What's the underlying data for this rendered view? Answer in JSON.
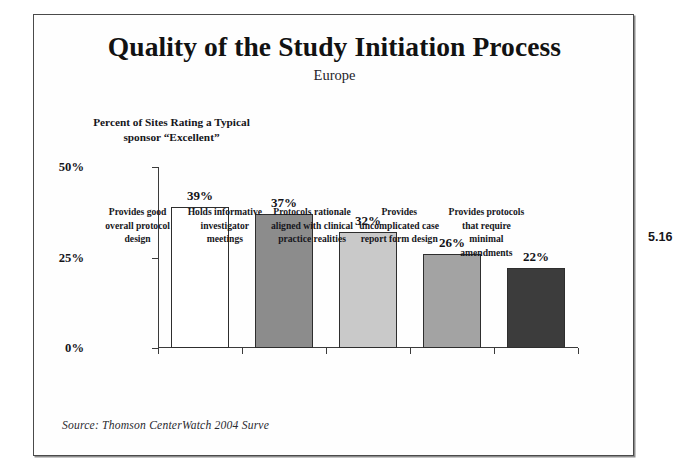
{
  "slide": {
    "title": "Quality of the Study Initiation Process",
    "subtitle": "Europe",
    "page_number": "5.16",
    "source": "Source:  Thomson CenterWatch 2004 Surve",
    "axis_caption_line1": "Percent of Sites Rating a Typical",
    "axis_caption_line2": "sponsor “Excellent”"
  },
  "chart_data": {
    "type": "bar",
    "title": "Quality of the Study Initiation Process",
    "subtitle": "Europe",
    "xlabel": "",
    "ylabel": "Percent of Sites Rating a Typical sponsor “Excellent”",
    "ylim": [
      0,
      50
    ],
    "ytick_labels": [
      "0%",
      "25%",
      "50%"
    ],
    "ytick_values": [
      0,
      25,
      50
    ],
    "grid": false,
    "legend": false,
    "categories": [
      "Provides good overall protocol design",
      "Holds informative investigator meetings",
      "Protocols rationale aligned with clinical practice realities",
      "Provides uncomplicated case report form design",
      "Provides protocols that require minimal amendments"
    ],
    "category_lines": [
      [
        "Provides good",
        "overall protocol",
        "design"
      ],
      [
        "Holds informative",
        "investigator",
        "meetings"
      ],
      [
        "Protocols rationale",
        "aligned with clinical",
        "practice realities"
      ],
      [
        "Provides",
        "uncomplicated case",
        "report form design"
      ],
      [
        "Provides protocols",
        "that require minimal",
        "amendments"
      ]
    ],
    "values": [
      39,
      37,
      32,
      26,
      22
    ],
    "value_labels": [
      "39%",
      "37%",
      "32%",
      "26%",
      "22%"
    ],
    "bar_colors": [
      "#ffffff",
      "#8c8c8c",
      "#c9c9c9",
      "#a3a3a3",
      "#3c3c3c"
    ],
    "bar_edge_color": "#2e2e2e",
    "source": "Source:  Thomson CenterWatch 2004 Surve"
  }
}
